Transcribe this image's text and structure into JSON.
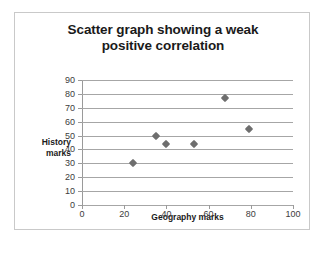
{
  "chart_data": {
    "type": "scatter",
    "title": "Scatter graph showing a weak positive correlation",
    "title_line1": "Scatter graph showing a weak",
    "title_line2": "positive correlation",
    "xlabel": "Geography marks",
    "ylabel": "History marks",
    "ylabel_line1": "History",
    "ylabel_line2": "marks",
    "xlim": [
      0,
      100
    ],
    "ylim": [
      0,
      90
    ],
    "xticks": [
      0,
      20,
      40,
      60,
      80,
      100
    ],
    "yticks": [
      0,
      10,
      20,
      30,
      40,
      50,
      60,
      70,
      80,
      90
    ],
    "grid": "horizontal",
    "legend": "none",
    "marker_shape": "diamond",
    "marker_color": "#6e6e6e",
    "points": [
      {
        "x": 24,
        "y": 30
      },
      {
        "x": 35,
        "y": 50
      },
      {
        "x": 40,
        "y": 44
      },
      {
        "x": 53,
        "y": 44
      },
      {
        "x": 68,
        "y": 77
      },
      {
        "x": 79,
        "y": 55
      }
    ]
  },
  "colors": {
    "gridline": "#a6a6a6",
    "axis": "#9a9a9a",
    "frame": "#c9c9c9",
    "text": "#1a1a1a",
    "background": "#ffffff"
  }
}
